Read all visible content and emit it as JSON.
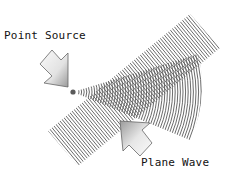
{
  "diagram": {
    "title": "",
    "labels": {
      "point_source": "Point Source",
      "plane_wave": "Plane Wave"
    },
    "elements": [
      {
        "id": "point-source-dot",
        "type": "circle",
        "cx": 73,
        "cy": 92,
        "r": 2.5,
        "color": "#555555"
      },
      {
        "id": "point-source-arrow",
        "type": "arrow",
        "direction": "down-right",
        "points_to": "point-source-dot"
      },
      {
        "id": "spherical-wavefronts",
        "type": "arc-wedge",
        "origin": [
          73,
          92
        ],
        "direction_deg": -5,
        "spread_deg": 38,
        "max_radius": 125
      },
      {
        "id": "plane-wavefronts",
        "type": "band",
        "from": [
          62,
          148
        ],
        "to": [
          205,
          32
        ],
        "width": 34
      },
      {
        "id": "plane-wave-arrow",
        "type": "arrow",
        "direction": "up-left"
      }
    ],
    "colors": {
      "lines": "#555555",
      "arrow_fill_light": "#f4f4f4",
      "arrow_fill_dark": "#9a9a9a",
      "arrow_stroke": "#666666",
      "text": "#111111"
    }
  }
}
